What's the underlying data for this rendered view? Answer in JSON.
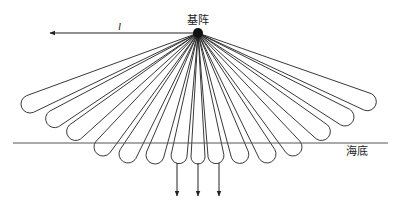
{
  "diagram": {
    "source": {
      "label": "基阵",
      "x": 198,
      "y": 33,
      "r": 5
    },
    "swath_arrow": {
      "label": "l",
      "x1": 198,
      "y1": 33,
      "x2": 50,
      "y2": 33,
      "label_x": 118,
      "label_y": 30
    },
    "seabed": {
      "label": "海底",
      "y": 143,
      "x1": 13,
      "x2": 388,
      "label_x": 346,
      "label_y": 155
    },
    "beams": [
      {
        "cx": 30,
        "cy": 104,
        "r": 9
      },
      {
        "cx": 54,
        "cy": 119,
        "r": 9
      },
      {
        "cx": 75,
        "cy": 132,
        "r": 9
      },
      {
        "cx": 103,
        "cy": 147,
        "r": 9
      },
      {
        "cx": 128,
        "cy": 154,
        "r": 9
      },
      {
        "cx": 155,
        "cy": 155,
        "r": 9
      },
      {
        "cx": 179,
        "cy": 156,
        "r": 8
      },
      {
        "cx": 198,
        "cy": 157,
        "r": 7
      },
      {
        "cx": 216,
        "cy": 156,
        "r": 8
      },
      {
        "cx": 240,
        "cy": 155,
        "r": 9
      },
      {
        "cx": 267,
        "cy": 154,
        "r": 9
      },
      {
        "cx": 293,
        "cy": 147,
        "r": 9
      },
      {
        "cx": 322,
        "cy": 132,
        "r": 9
      },
      {
        "cx": 345,
        "cy": 117,
        "r": 9
      },
      {
        "cx": 368,
        "cy": 102,
        "r": 9
      }
    ],
    "down_arrows": [
      {
        "x": 177,
        "y1": 163,
        "y2": 196
      },
      {
        "x": 198,
        "y1": 163,
        "y2": 196
      },
      {
        "x": 219,
        "y1": 163,
        "y2": 196
      }
    ],
    "colors": {
      "stroke": "#222222",
      "seabed": "#555555",
      "background": "#ffffff"
    }
  }
}
